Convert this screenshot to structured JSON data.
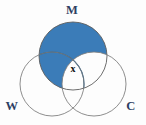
{
  "figure": {
    "type": "venn-diagram",
    "background_color": "#fdfdfd",
    "width": 146,
    "height": 125
  },
  "colors": {
    "shaded_fill": "#3b7cb8",
    "shaded_fill_dark": "#35709f",
    "unshaded_fill": "#ffffff",
    "outline": "#5e5e5e",
    "set_label_color": "#2e3f63",
    "region_label_color": "#101010"
  },
  "sets": [
    {
      "id": "M",
      "label": "M",
      "label_x": 72,
      "label_y": 14,
      "cx": 73,
      "cy": 56,
      "r": 34,
      "shaded": true
    },
    {
      "id": "W",
      "label": "W",
      "label_x": 12,
      "label_y": 110,
      "cx": 52,
      "cy": 84,
      "r": 32,
      "shaded": false
    },
    {
      "id": "C",
      "label": "C",
      "label_x": 131,
      "label_y": 110,
      "cx": 94,
      "cy": 84,
      "r": 32,
      "shaded": false
    }
  ],
  "region_labels": [
    {
      "id": "triple-intersection",
      "text": "x",
      "x": 73,
      "y": 72,
      "region": "M-and-W-and-C"
    }
  ],
  "shading": {
    "description": "M circle filled blue except the lens shared with C",
    "filled_regions": [
      "M-only",
      "M-and-W-only"
    ],
    "unfilled_regions": [
      "W-only",
      "C-only",
      "M-and-C-only",
      "M-and-W-and-C",
      "W-and-C-only"
    ]
  }
}
